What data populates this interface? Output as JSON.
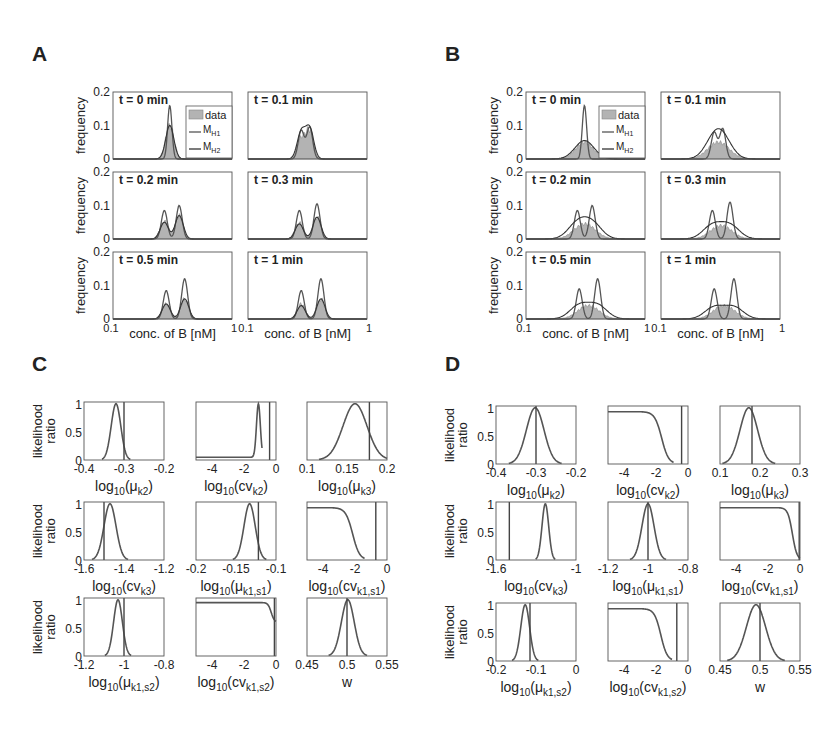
{
  "panels": {
    "A": {
      "label": "A"
    },
    "B": {
      "label": "B"
    },
    "C": {
      "label": "C"
    },
    "D": {
      "label": "D"
    }
  },
  "chart_data": [
    {
      "panel": "A",
      "type": "area",
      "description": "Histograms of concentration of B with model fits",
      "xlabel": "conc. of B [nM]",
      "ylabel": "frequency",
      "xscale": "log",
      "xlim": [
        0.1,
        1
      ],
      "xticks": [
        "0.1",
        "1"
      ],
      "ylim": [
        0,
        0.2
      ],
      "yticks": [
        "0",
        "0.1",
        "0.2"
      ],
      "legend": [
        "data",
        "M_H1",
        "M_H2"
      ],
      "legend_position": "top-right of first subplot",
      "subplots": [
        {
          "title": "t = 0 min",
          "data_peak": 0.1,
          "MH1_peaks": [
            0.16
          ],
          "MH2_peaks": [
            0.1
          ],
          "peak_x": [
            0.3
          ]
        },
        {
          "title": "t = 0.1 min",
          "data_peak": 0.08,
          "MH1_peaks": [
            0.085,
            0.095
          ],
          "MH2_peaks": [
            0.08,
            0.09
          ],
          "peak_x": [
            0.28,
            0.33
          ]
        },
        {
          "title": "t = 0.2 min",
          "data_peak": 0.07,
          "MH1_peaks": [
            0.085,
            0.1
          ],
          "MH2_peaks": [
            0.05,
            0.07
          ],
          "peak_x": [
            0.27,
            0.36
          ]
        },
        {
          "title": "t = 0.3 min",
          "data_peak": 0.065,
          "MH1_peaks": [
            0.085,
            0.105
          ],
          "MH2_peaks": [
            0.045,
            0.065
          ],
          "peak_x": [
            0.27,
            0.38
          ]
        },
        {
          "title": "t = 0.5 min",
          "data_peak": 0.06,
          "MH1_peaks": [
            0.085,
            0.12
          ],
          "MH2_peaks": [
            0.045,
            0.06
          ],
          "peak_x": [
            0.28,
            0.4
          ]
        },
        {
          "title": "t = 1 min",
          "data_peak": 0.06,
          "MH1_peaks": [
            0.085,
            0.12
          ],
          "MH2_peaks": [
            0.04,
            0.06
          ],
          "peak_x": [
            0.28,
            0.41
          ]
        }
      ]
    },
    {
      "panel": "B",
      "type": "area",
      "description": "Histograms of concentration of B with model fits",
      "xlabel": "conc. of B [nM]",
      "ylabel": "frequency",
      "xscale": "log",
      "xlim": [
        0.1,
        1
      ],
      "xticks": [
        "0.1",
        "1"
      ],
      "ylim": [
        0,
        0.2
      ],
      "yticks": [
        "0",
        "0.1",
        "0.2"
      ],
      "legend": [
        "data",
        "M_H1",
        "M_H2"
      ],
      "subplots": [
        {
          "title": "t = 0 min",
          "data_peak": 0.05,
          "MH1_peaks": [
            0.16
          ],
          "MH2_peaks": [
            0.055
          ],
          "peak_x": [
            0.31
          ]
        },
        {
          "title": "t = 0.1 min",
          "data_peak": 0.05,
          "MH1_peaks": [
            0.08,
            0.09
          ],
          "MH2_peaks": [
            0.05
          ],
          "peak_x": [
            0.28,
            0.33
          ]
        },
        {
          "title": "t = 0.2 min",
          "data_peak": 0.045,
          "MH1_peaks": [
            0.085,
            0.1
          ],
          "MH2_peaks": [
            0.045
          ],
          "peak_x": [
            0.27,
            0.36
          ]
        },
        {
          "title": "t = 0.3 min",
          "data_peak": 0.04,
          "MH1_peaks": [
            0.085,
            0.11
          ],
          "MH2_peaks": [
            0.04
          ],
          "peak_x": [
            0.27,
            0.38
          ]
        },
        {
          "title": "t = 0.5 min",
          "data_peak": 0.04,
          "MH1_peaks": [
            0.09,
            0.12
          ],
          "MH2_peaks": [
            0.04
          ],
          "peak_x": [
            0.28,
            0.4
          ]
        },
        {
          "title": "t = 1 min",
          "data_peak": 0.04,
          "MH1_peaks": [
            0.09,
            0.12
          ],
          "MH2_peaks": [
            0.035
          ],
          "peak_x": [
            0.28,
            0.41
          ]
        }
      ]
    },
    {
      "panel": "C",
      "type": "line",
      "ylabel": "likelihood ratio",
      "ylim": [
        0,
        1
      ],
      "yticks": [
        "0",
        "0.5",
        "1"
      ],
      "subplots": [
        {
          "xlabel": "log10(μk2)",
          "xlabel_base": "log",
          "xlabel_sub": "10",
          "xlabel_arg": "(μ",
          "xlabel_argsub": "k2",
          "xlim": [
            -0.4,
            -0.2
          ],
          "xticks": [
            "-0.4",
            "-0.3",
            "-0.2"
          ],
          "shape": "gauss",
          "center": -0.32,
          "width": 0.012,
          "true_value": -0.3
        },
        {
          "xlabel": "log10(cvk2)",
          "xlabel_base": "log",
          "xlabel_sub": "10",
          "xlabel_arg": "(cv",
          "xlabel_argsub": "k2",
          "xlim": [
            -5,
            0
          ],
          "xticks": [
            "-4",
            "-2",
            "0"
          ],
          "shape": "spike",
          "center": -1.1,
          "baseline": 0.05,
          "true_value": -0.4
        },
        {
          "xlabel": "log10(μk3)",
          "xlabel_base": "log",
          "xlabel_sub": "10",
          "xlabel_arg": "(μ",
          "xlabel_argsub": "k3",
          "xlim": [
            0.1,
            0.2
          ],
          "xticks": [
            "0.1",
            "0.15",
            "0.2"
          ],
          "shape": "gauss",
          "center": 0.16,
          "width": 0.015,
          "true_value": 0.178
        },
        {
          "xlabel": "log10(cvk3)",
          "xlabel_base": "log",
          "xlabel_sub": "10",
          "xlabel_arg": "(cv",
          "xlabel_argsub": "k3",
          "xlim": [
            -1.6,
            -1.2
          ],
          "xticks": [
            "-1.6",
            "-1.4",
            "-1.2"
          ],
          "shape": "gauss",
          "center": -1.47,
          "width": 0.03,
          "true_value": -1.5
        },
        {
          "xlabel": "log10(μk1,s1)",
          "xlabel_base": "log",
          "xlabel_sub": "10",
          "xlabel_arg": "(μ",
          "xlabel_argsub": "k1,s1",
          "xlim": [
            -0.2,
            -0.1
          ],
          "xticks": [
            "-0.2",
            "-0.15",
            "-0.1"
          ],
          "shape": "gauss",
          "center": -0.133,
          "width": 0.007,
          "true_value": -0.122
        },
        {
          "xlabel": "log10(cvk1,s1)",
          "xlabel_base": "log",
          "xlabel_sub": "10",
          "xlabel_arg": "(cv",
          "xlabel_argsub": "k1,s1",
          "xlim": [
            -5,
            0
          ],
          "xticks": [
            "-4",
            "-2",
            "0"
          ],
          "shape": "plateau",
          "drop_start": -2.8,
          "drop_end": -1.5,
          "plateau": 0.93,
          "true_value": -0.7
        },
        {
          "xlabel": "log10(μk1,s2)",
          "xlabel_base": "log",
          "xlabel_sub": "10",
          "xlabel_arg": "(μ",
          "xlabel_argsub": "k1,s2",
          "xlim": [
            -1.2,
            -0.8
          ],
          "xticks": [
            "-1.2",
            "-1",
            "-0.8"
          ],
          "shape": "gauss",
          "center": -1.03,
          "width": 0.022,
          "true_value": -1.0
        },
        {
          "xlabel": "log10(cvk1,s2)",
          "xlabel_base": "log",
          "xlabel_sub": "10",
          "xlabel_arg": "(cv",
          "xlabel_argsub": "k1,s2",
          "xlim": [
            -5,
            0
          ],
          "xticks": [
            "-4",
            "-2",
            "0"
          ],
          "shape": "plateau",
          "drop_start": -0.6,
          "drop_end": 0,
          "plateau": 0.95,
          "end_value": 0.6,
          "true_value": -0.1
        },
        {
          "xlabel": "w",
          "xlabel_base": "w",
          "xlabel_sub": "",
          "xlabel_arg": "",
          "xlabel_argsub": "",
          "xlim": [
            0.45,
            0.55
          ],
          "xticks": [
            "0.45",
            "0.5",
            "0.55"
          ],
          "shape": "gauss",
          "center": 0.501,
          "width": 0.008,
          "true_value": 0.5
        }
      ]
    },
    {
      "panel": "D",
      "type": "line",
      "ylabel": "likelihood ratio",
      "ylim": [
        0,
        1
      ],
      "yticks": [
        "0",
        "0.5",
        "1"
      ],
      "subplots": [
        {
          "xlabel": "log10(μk2)",
          "xlabel_base": "log",
          "xlabel_sub": "10",
          "xlabel_arg": "(μ",
          "xlabel_argsub": "k2",
          "xlim": [
            -0.4,
            -0.2
          ],
          "xticks": [
            "-0.4",
            "-0.3",
            "-0.2"
          ],
          "shape": "gauss",
          "center": -0.302,
          "width": 0.022,
          "true_value": -0.3
        },
        {
          "xlabel": "log10(cvk2)",
          "xlabel_base": "log",
          "xlabel_sub": "10",
          "xlabel_arg": "(cv",
          "xlabel_argsub": "k2",
          "xlim": [
            -5,
            0
          ],
          "xticks": [
            "-4",
            "-2",
            "0"
          ],
          "shape": "plateau",
          "drop_start": -2.3,
          "drop_end": -1.0,
          "plateau": 0.93,
          "true_value": -0.4
        },
        {
          "xlabel": "log10(μk3)",
          "xlabel_base": "log",
          "xlabel_sub": "10",
          "xlabel_arg": "(μ",
          "xlabel_argsub": "k3",
          "xlim": [
            0.1,
            0.3
          ],
          "xticks": [
            "0.1",
            "0.2",
            "0.3"
          ],
          "shape": "gauss",
          "center": 0.172,
          "width": 0.022,
          "true_value": 0.18
        },
        {
          "xlabel": "log10(cvk3)",
          "xlabel_base": "log",
          "xlabel_sub": "10",
          "xlabel_arg": "(cv",
          "xlabel_argsub": "k3",
          "xlim": [
            -1.6,
            -1.0
          ],
          "xticks": [
            "-1.6",
            "",
            "-1"
          ],
          "shape": "gauss",
          "center": -1.23,
          "width": 0.025,
          "true_value": -1.5
        },
        {
          "xlabel": "log10(μk1,s1)",
          "xlabel_base": "log",
          "xlabel_sub": "10",
          "xlabel_arg": "(μ",
          "xlabel_argsub": "k1,s1",
          "xlim": [
            -1.2,
            -0.8
          ],
          "xticks": [
            "-1.2",
            "-1",
            "-0.8"
          ],
          "shape": "gauss",
          "center": -1.0,
          "width": 0.03,
          "true_value": -1.0
        },
        {
          "xlabel": "log10(cvk1,s1)",
          "xlabel_base": "log",
          "xlabel_sub": "10",
          "xlabel_arg": "(cv",
          "xlabel_argsub": "k1,s1",
          "xlim": [
            -5,
            0
          ],
          "xticks": [
            "-4",
            "-2",
            "0"
          ],
          "shape": "plateau",
          "drop_start": -0.9,
          "drop_end": -0.05,
          "plateau": 0.93,
          "end_value": 0.0,
          "true_value": -0.05
        },
        {
          "xlabel": "log10(μk1,s2)",
          "xlabel_base": "log",
          "xlabel_sub": "10",
          "xlabel_arg": "(μ",
          "xlabel_argsub": "k1,s2",
          "xlim": [
            -0.2,
            0
          ],
          "xticks": [
            "-0.2",
            "-0.1",
            "0"
          ],
          "shape": "gauss",
          "center": -0.127,
          "width": 0.011,
          "true_value": -0.115
        },
        {
          "xlabel": "log10(cvk1,s2)",
          "xlabel_base": "log",
          "xlabel_sub": "10",
          "xlabel_arg": "(cv",
          "xlabel_argsub": "k1,s2",
          "xlim": [
            -5,
            0
          ],
          "xticks": [
            "-4",
            "-2",
            "0"
          ],
          "shape": "plateau",
          "drop_start": -2.3,
          "drop_end": -1.1,
          "plateau": 0.93,
          "true_value": -0.7
        },
        {
          "xlabel": "w",
          "xlabel_base": "w",
          "xlabel_sub": "",
          "xlabel_arg": "",
          "xlabel_argsub": "",
          "xlim": [
            0.45,
            0.55
          ],
          "xticks": [
            "0.45",
            "0.5",
            "0.55"
          ],
          "shape": "gauss",
          "center": 0.495,
          "width": 0.012,
          "true_value": 0.5
        }
      ]
    }
  ],
  "style": {
    "fill": "#b3b3b3",
    "line": "#555555",
    "axis": "#555555",
    "text": "#222222"
  }
}
